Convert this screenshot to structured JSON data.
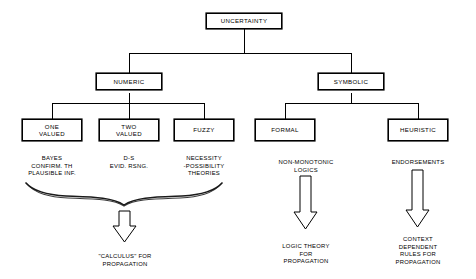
{
  "diagram": {
    "title": "UNCERTAINTY",
    "root": {
      "id": "uncertainty",
      "label": "UNCERTAINTY"
    },
    "level2": [
      {
        "id": "numeric",
        "label": "NUMERIC"
      },
      {
        "id": "symbolic",
        "label": "SYMBOLIC"
      }
    ],
    "level3": [
      {
        "id": "one-valued",
        "label": "ONE\nVALUED",
        "parent": "numeric"
      },
      {
        "id": "two-valued",
        "label": "TWO\nVALUED",
        "parent": "numeric"
      },
      {
        "id": "fuzzy",
        "label": "FUZZY",
        "parent": "numeric"
      },
      {
        "id": "formal",
        "label": "FORMAL",
        "parent": "symbolic"
      },
      {
        "id": "heuristic",
        "label": "HEURISTIC",
        "parent": "symbolic"
      }
    ],
    "captions": [
      {
        "id": "one-valued-caption",
        "for": "one-valued",
        "text": "BAYES\nCONFIRM. TH\nPLAUSIBLE INF."
      },
      {
        "id": "two-valued-caption",
        "for": "two-valued",
        "text": "D-S\nEVID. RSNG."
      },
      {
        "id": "fuzzy-caption",
        "for": "fuzzy",
        "text": "NECESSITY\n-POSSIBILITY\nTHEORIES"
      },
      {
        "id": "formal-caption",
        "for": "formal",
        "text": "NON-MONOTONIC\nLOGICS"
      },
      {
        "id": "heuristic-caption",
        "for": "heuristic",
        "text": "ENDORSEMENTS"
      }
    ],
    "outcomes": [
      {
        "id": "numeric-outcome",
        "text": "\"CALCULUS\" FOR\nPROPAGATION"
      },
      {
        "id": "formal-outcome",
        "text": "LOGIC THEORY\nFOR\nPROPAGATION"
      },
      {
        "id": "heuristic-outcome",
        "text": "CONTEXT\nDEPENDENT\nRULES FOR\nPROPAGATION"
      }
    ],
    "glyphs": {
      "brace": "curly-brace-up",
      "arrows": [
        "hollow-down-arrow",
        "hollow-down-arrow",
        "hollow-down-arrow"
      ]
    },
    "colors": {
      "line": "#000000",
      "text": "#000000",
      "background": "#ffffff"
    }
  }
}
